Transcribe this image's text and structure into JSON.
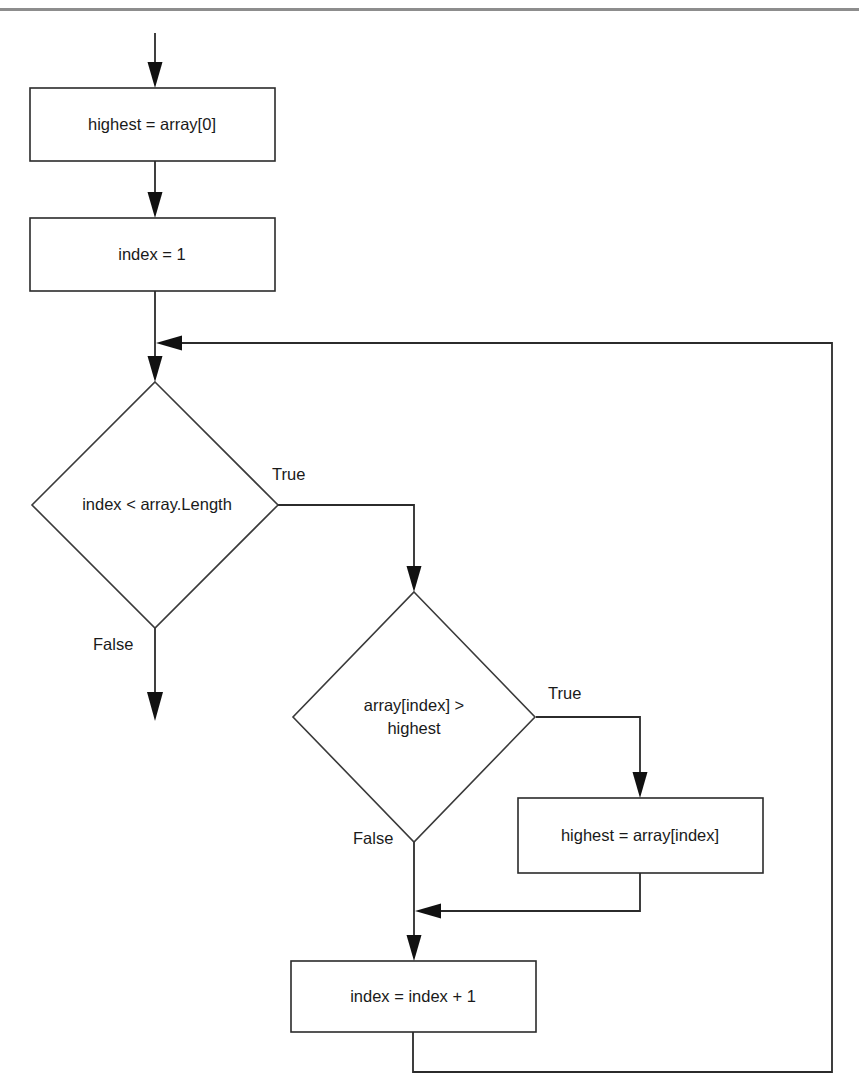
{
  "page": {
    "width": 859,
    "height": 1091,
    "background_color": "#ffffff",
    "line_color": "#2b2b2b",
    "text_color": "#1a1a1a",
    "rule_color": "#8d8d8d"
  },
  "diagram": {
    "type": "flowchart",
    "orientation": "top-to-bottom",
    "nodes": [
      {
        "id": "init-highest",
        "kind": "process",
        "label": "highest = array[0]",
        "x": 30,
        "y": 88,
        "w": 245,
        "h": 73
      },
      {
        "id": "init-index",
        "kind": "process",
        "label": "index = 1",
        "x": 30,
        "y": 218,
        "w": 245,
        "h": 73
      },
      {
        "id": "loop-condition",
        "kind": "decision",
        "label": "index < array.Length",
        "cx": 155,
        "cy": 505,
        "rx": 123,
        "ry": 123
      },
      {
        "id": "compare-condition",
        "kind": "decision",
        "label_line1": "array[index] >",
        "label_line2": "highest",
        "cx": 414,
        "cy": 717,
        "rx": 121,
        "ry": 125
      },
      {
        "id": "assign-highest",
        "kind": "process",
        "label": "highest = array[index]",
        "x": 518,
        "y": 798,
        "w": 245,
        "h": 75
      },
      {
        "id": "increment-index",
        "kind": "process",
        "label": "index = index + 1",
        "x": 291,
        "y": 961,
        "w": 245,
        "h": 71
      }
    ],
    "edge_labels": [
      {
        "id": "loop-true-label",
        "text": "True",
        "x": 272,
        "y": 476
      },
      {
        "id": "loop-false-label",
        "text": "False",
        "x": 93,
        "y": 646
      },
      {
        "id": "cmp-true-label",
        "text": "True",
        "x": 548,
        "y": 695
      },
      {
        "id": "cmp-false-label",
        "text": "False",
        "x": 353,
        "y": 840
      }
    ],
    "edges": [
      {
        "id": "entry-to-init-highest",
        "from": "entry",
        "to": "init-highest"
      },
      {
        "id": "init-highest-to-init-index",
        "from": "init-highest",
        "to": "init-index"
      },
      {
        "id": "init-index-to-loop-condition",
        "from": "init-index",
        "to": "loop-condition"
      },
      {
        "id": "loop-true-to-compare",
        "from": "loop-condition",
        "to": "compare-condition",
        "label": "True"
      },
      {
        "id": "loop-false-to-exit",
        "from": "loop-condition",
        "to": "exit",
        "label": "False"
      },
      {
        "id": "compare-true-to-assign",
        "from": "compare-condition",
        "to": "assign-highest",
        "label": "True"
      },
      {
        "id": "compare-false-to-merge",
        "from": "compare-condition",
        "to": "increment-index",
        "label": "False"
      },
      {
        "id": "assign-highest-to-merge",
        "from": "assign-highest",
        "to": "increment-index"
      },
      {
        "id": "increment-index-loop-back",
        "from": "increment-index",
        "to": "loop-condition"
      }
    ]
  },
  "top_rule": {
    "y": 8,
    "height": 3
  }
}
